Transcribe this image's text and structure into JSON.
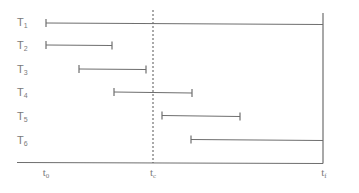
{
  "diagram": {
    "type": "interval-timeline",
    "colors": {
      "line": "#6e6e6e",
      "text": "#7a7a7a",
      "background": "#ffffff"
    },
    "tasks": [
      {
        "label": "T",
        "sub": "1",
        "start": "t0",
        "end": "tf"
      },
      {
        "label": "T",
        "sub": "2",
        "start": "t0",
        "end": "before tc"
      },
      {
        "label": "T",
        "sub": "3",
        "start": "after t0",
        "end": "before tc"
      },
      {
        "label": "T",
        "sub": "4",
        "start": "before tc",
        "end": "after tc"
      },
      {
        "label": "T",
        "sub": "5",
        "start": "after tc",
        "end": "before tf"
      },
      {
        "label": "T",
        "sub": "6",
        "start": "after tc",
        "end": "tf"
      }
    ],
    "axis": {
      "ticks": [
        {
          "label": "t",
          "sub": "0"
        },
        {
          "label": "t",
          "sub": "c"
        },
        {
          "label": "t",
          "sub": "f"
        }
      ]
    }
  }
}
